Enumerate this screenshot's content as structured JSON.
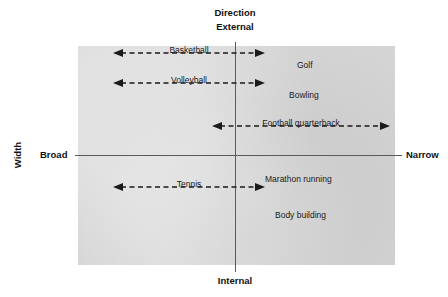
{
  "diagram": {
    "type": "quadrant-matrix",
    "title_axes": {
      "vertical_axis_name": "Direction",
      "vertical_top_label": "External",
      "vertical_bottom_label": "Internal",
      "horizontal_axis_name": "Width",
      "horizontal_left_label": "Broad",
      "horizontal_right_label": "Narrow"
    },
    "colors": {
      "panel_fill": "#d5d5d5",
      "axis_line": "#5a5a5a",
      "text": "#1a1a1a",
      "background": "#ffffff"
    },
    "arrow_items": [
      {
        "label": "Basketball",
        "quadrant": "broad-external"
      },
      {
        "label": "Volleyball",
        "quadrant": "broad-external"
      },
      {
        "label": "Football quarterback",
        "quadrant": "external-narrow"
      },
      {
        "label": "Tennis",
        "quadrant": "broad-internal"
      }
    ],
    "point_items": [
      {
        "label": "Golf",
        "quadrant": "narrow-external"
      },
      {
        "label": "Bowling",
        "quadrant": "narrow-external"
      },
      {
        "label": "Marathon running",
        "quadrant": "narrow-internal"
      },
      {
        "label": "Body building",
        "quadrant": "narrow-internal"
      }
    ]
  }
}
